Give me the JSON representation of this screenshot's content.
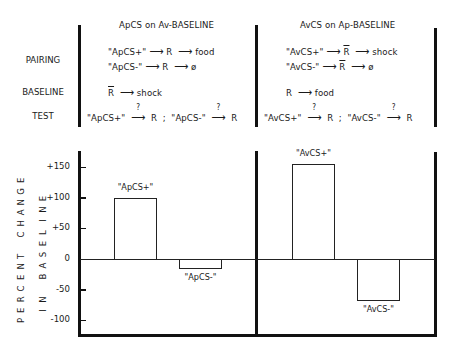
{
  "panels": [
    {
      "title": "ApCS on Av-BASELINE",
      "pairing": [
        "\"ApCS+\" ⟶ R ⟶ food",
        "\"ApCS-\" ⟶ R ⟶ ø"
      ],
      "pairing_parts": [
        {
          "cs": "\"ApCS+\"",
          "r": "R",
          "outcome": "food",
          "r_bar": false
        },
        {
          "cs": "\"ApCS-\"",
          "r": "R",
          "outcome": "ø",
          "r_bar": false
        }
      ],
      "baseline": {
        "r": "R",
        "r_bar": true,
        "outcome": "shock"
      },
      "test": [
        {
          "cs": "\"ApCS+\"",
          "q": "?",
          "r": "R"
        },
        {
          "cs": "\"ApCS-\"",
          "q": "?",
          "r": "R"
        }
      ]
    },
    {
      "title": "AvCS on Ap-BASELINE",
      "pairing_parts": [
        {
          "cs": "\"AvCS+\"",
          "r": "R",
          "outcome": "shock",
          "r_bar": true
        },
        {
          "cs": "\"AvCS-\"",
          "r": "R",
          "outcome": "ø",
          "r_bar": true
        }
      ],
      "baseline": {
        "r": "R",
        "r_bar": false,
        "outcome": "food"
      },
      "test": [
        {
          "cs": "\"AvCS+\"",
          "q": "?",
          "r": "R"
        },
        {
          "cs": "\"AvCS-\"",
          "q": "?",
          "r": "R"
        }
      ]
    }
  ],
  "row_labels": {
    "pairing": "PAIRING",
    "baseline": "BASELINE",
    "test": "TEST"
  },
  "symbols": {
    "arrow": "⟶",
    "separator": ";"
  },
  "chart_data": {
    "type": "bar",
    "title": "",
    "xlabel": "",
    "ylabel": "PERCENT CHANGE IN BASELINE",
    "ylabel_lines": [
      "PERCENT CHANGE",
      "IN BASELINE"
    ],
    "categories": [
      "\"ApCS+\"",
      "\"ApCS-\"",
      "\"AvCS+\"",
      "\"AvCS-\""
    ],
    "values": [
      100,
      -15,
      155,
      -67
    ],
    "groups": [
      {
        "name": "ApCS on Av-BASELINE",
        "categories": [
          "\"ApCS+\"",
          "\"ApCS-\""
        ],
        "values": [
          100,
          -15
        ]
      },
      {
        "name": "AvCS on Ap-BASELINE",
        "categories": [
          "\"AvCS+\"",
          "\"AvCS-\""
        ],
        "values": [
          155,
          -67
        ]
      }
    ],
    "yticks": [
      "+150",
      "+100",
      "+50",
      "0",
      "-50",
      "-100"
    ],
    "ytick_values": [
      150,
      100,
      50,
      0,
      -50,
      -100
    ],
    "ylim": [
      -120,
      170
    ],
    "grid": false,
    "legend": "none"
  }
}
